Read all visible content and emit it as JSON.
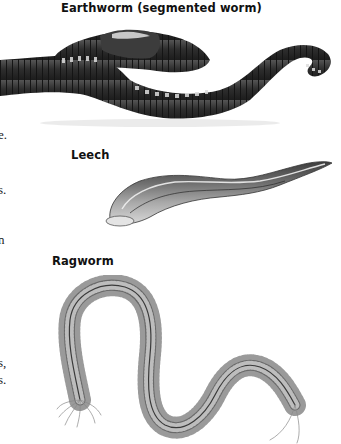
{
  "figures": [
    {
      "id": "earthworm",
      "caption": "Earthworm (segmented worm)"
    },
    {
      "id": "leech",
      "caption": "Leech"
    },
    {
      "id": "ragworm",
      "caption": "Ragworm"
    }
  ],
  "cropped_body_text": [
    {
      "text": "e."
    },
    {
      "text": "s."
    },
    {
      "text": "n"
    },
    {
      "text": "s,"
    },
    {
      "text": "s."
    }
  ],
  "colors": {
    "earthworm_body": "#3a3a3a",
    "earthworm_highlight": "#d8d8d8",
    "leech_dark": "#4a4a4a",
    "leech_light": "#cfcfcf",
    "ragworm": "#6a6a6a"
  }
}
